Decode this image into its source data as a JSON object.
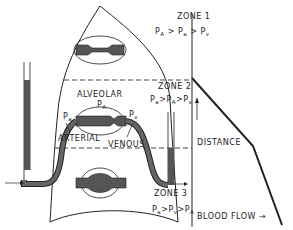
{
  "diagram": {
    "zones": [
      {
        "label": "ZONE 1",
        "relation": [
          "P",
          "A",
          ">",
          "P",
          "a",
          ">",
          "P",
          "v"
        ]
      },
      {
        "label": "ZONE 2",
        "relation": [
          "P",
          "a",
          ">",
          "P",
          "A",
          ">",
          "P",
          "v"
        ]
      },
      {
        "label": "ZONE 3",
        "relation": [
          "P",
          "a",
          ">",
          "P",
          "v",
          ">",
          "P",
          "A"
        ]
      }
    ],
    "labels": {
      "alveolar": "ALVEOLAR",
      "arterial": "ARTERIAL",
      "venous": "VENOUS",
      "pa_alveolar": "P",
      "pa_alveolar_sub": "A",
      "pa_arterial": "P",
      "pa_arterial_sub": "a",
      "pv": "P",
      "pv_sub": "v"
    },
    "graph": {
      "y_axis_label": "DISTANCE",
      "x_axis_label": "BLOOD FLOW",
      "arrow": "→"
    },
    "colors": {
      "line": "#222222",
      "vessel_fill": "#555555",
      "background": "#ffffff"
    }
  }
}
